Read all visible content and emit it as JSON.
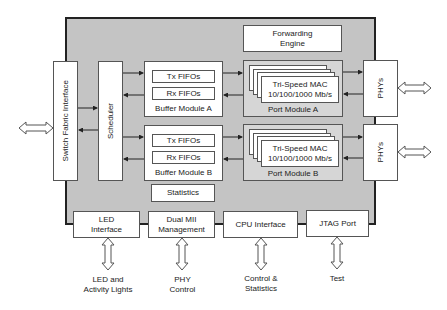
{
  "diagram": {
    "type": "block-diagram",
    "chip": {
      "forwarding_engine": {
        "line1": "Forwarding",
        "line2": "Engine"
      },
      "switch_fabric_interface": "Switch Fabric Interface",
      "scheduler": "Scheduler",
      "buffer_module_a": {
        "label": "Buffer Module A",
        "tx": "Tx FIFOs",
        "rx": "Rx FIFOs"
      },
      "buffer_module_b": {
        "label": "Buffer Module B",
        "tx": "Tx FIFOs",
        "rx": "Rx FIFOs"
      },
      "statistics": "Statistics",
      "port_module_a": {
        "label": "Port Module A",
        "mac_line1": "Tri-Speed MAC",
        "mac_line2": "10/100/1000 Mb/s"
      },
      "port_module_b": {
        "label": "Port Module B",
        "mac_line1": "Tri-Speed MAC",
        "mac_line2": "10/100/1000 Mb/s"
      },
      "led_interface": {
        "line1": "LED",
        "line2": "Interface"
      },
      "dual_mii": {
        "line1": "Dual MII",
        "line2": "Management"
      },
      "cpu_interface": "CPU Interface",
      "jtag_port": "JTAG Port"
    },
    "external": {
      "phys_a": "PHYs",
      "phys_b": "PHYs",
      "led_lights": {
        "line1": "LED and",
        "line2": "Activity Lights"
      },
      "phy_control": {
        "line1": "PHY",
        "line2": "Control"
      },
      "control_stats": {
        "line1": "Control &",
        "line2": "Statistics"
      },
      "test": "Test"
    },
    "colors": {
      "chip_fill": "#c4c4c4",
      "port_module_fill": "#d6d6d6",
      "box_fill": "#ffffff",
      "border": "#222222"
    }
  }
}
